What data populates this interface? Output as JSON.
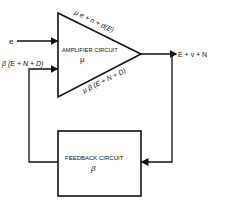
{
  "diagram": {
    "amplifier": {
      "label": "AMPLIFIER CIRCUIT",
      "gain_symbol": "μ",
      "top_edge_label": "μ e + n + d(E)",
      "bottom_edge_label": "μ β (E + N + D)"
    },
    "feedback": {
      "label": "FEEDBACK CIRCUIT",
      "gain_symbol": "β"
    },
    "input_label": "e",
    "feedback_input_label": "β (E + N + D)",
    "output_label": "E + ν + N",
    "colors": {
      "line": "#111111",
      "background": "#ffffff"
    }
  }
}
